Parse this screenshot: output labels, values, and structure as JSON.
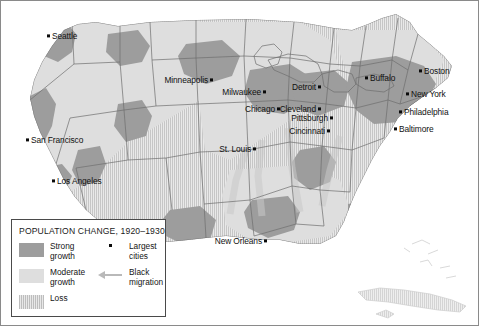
{
  "map": {
    "title": "Population Change in the United States, 1920-1930",
    "border_color": "#7a7a7a",
    "background": "#ffffff",
    "colors": {
      "strong_growth": "#9d9d9d",
      "moderate_growth": "#dedede",
      "loss": "#d8d8d8",
      "water": "#ffffff",
      "state_border": "#6e6e6e",
      "arrow": "#b9b9b9",
      "city_dot": "#0b0b0b",
      "label_text": "#111111"
    }
  },
  "legend": {
    "title": "POPULATION CHANGE, 1920–1930",
    "items": [
      {
        "swatch": "strong-growth-swatch",
        "label": "Strong\ngrowth",
        "line1": "Strong",
        "line2": "growth"
      },
      {
        "swatch": "moderate-growth-swatch",
        "label": "Moderate\ngrowth",
        "line1": "Moderate",
        "line2": "growth"
      },
      {
        "swatch": "loss-swatch",
        "label": "Loss",
        "line1": "Loss",
        "line2": ""
      }
    ],
    "keys": [
      {
        "icon": "largest-cities-dot-icon",
        "line1": "Largest",
        "line2": "cities"
      },
      {
        "icon": "black-migration-arrow-icon",
        "line1": "Black",
        "line2": "migration"
      }
    ]
  },
  "cities": [
    {
      "name": "Seattle",
      "label": "Seattle",
      "x": 52,
      "y": 32,
      "side": "r"
    },
    {
      "name": "San Francisco",
      "label": "San Francisco",
      "x": 31,
      "y": 136,
      "side": "r"
    },
    {
      "name": "Los Angeles",
      "label": "Los Angeles",
      "x": 57,
      "y": 177,
      "side": "r"
    },
    {
      "name": "Minneapolis",
      "label": "Minneapolis",
      "x": 208,
      "y": 76,
      "side": "l"
    },
    {
      "name": "Milwaukee",
      "label": "Milwaukee",
      "x": 261,
      "y": 88,
      "side": "l"
    },
    {
      "name": "Chicago",
      "label": "Chicago",
      "x": 275,
      "y": 105,
      "side": "l"
    },
    {
      "name": "St. Louis",
      "label": "St. Louis",
      "x": 251,
      "y": 145,
      "side": "l"
    },
    {
      "name": "Detroit",
      "label": "Detroit",
      "x": 316,
      "y": 83,
      "side": "l"
    },
    {
      "name": "Cleveland",
      "label": "Cleveland",
      "x": 316,
      "y": 105,
      "side": "l"
    },
    {
      "name": "Pittsburgh",
      "label": "Pittsburgh",
      "x": 328,
      "y": 114,
      "side": "l"
    },
    {
      "name": "Cincinnati",
      "label": "Cincinnati",
      "x": 325,
      "y": 127,
      "side": "l"
    },
    {
      "name": "Buffalo",
      "label": "Buffalo",
      "x": 370,
      "y": 74,
      "side": "r"
    },
    {
      "name": "Boston",
      "label": "Boston",
      "x": 424,
      "y": 67,
      "side": "r"
    },
    {
      "name": "New York",
      "label": "New York",
      "x": 411,
      "y": 90,
      "side": "r"
    },
    {
      "name": "Philadelphia",
      "label": "Philadelphia",
      "x": 404,
      "y": 108,
      "side": "r"
    },
    {
      "name": "Baltimore",
      "label": "Baltimore",
      "x": 399,
      "y": 125,
      "side": "r"
    },
    {
      "name": "New Orleans",
      "label": "New Orleans",
      "x": 262,
      "y": 237,
      "side": "l"
    }
  ]
}
